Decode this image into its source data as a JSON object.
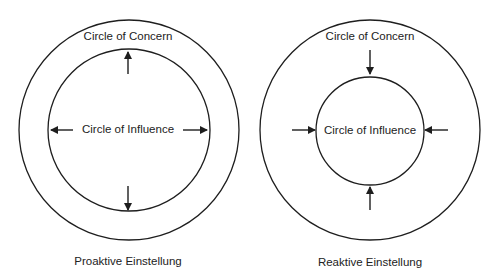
{
  "diagrams": [
    {
      "id": "proactive",
      "caption": "Proaktive Einstellung",
      "outer_label": "Circle of Concern",
      "inner_label": "Circle of Influence",
      "arrow_direction": "outward",
      "outer_circle": {
        "cx": 129,
        "cy": 130,
        "r": 110
      },
      "inner_circle": {
        "cx": 129,
        "cy": 130,
        "r": 81
      }
    },
    {
      "id": "reactive",
      "caption": "Reaktive Einstellung",
      "outer_label": "Circle of Concern",
      "inner_label": "Circle of Influence",
      "arrow_direction": "inward",
      "outer_circle": {
        "cx": 370,
        "cy": 130,
        "r": 110
      },
      "inner_circle": {
        "cx": 370,
        "cy": 131,
        "r": 54
      }
    }
  ],
  "colors": {
    "stroke": "#1e1e1e",
    "text": "#222222",
    "background": "#ffffff"
  }
}
